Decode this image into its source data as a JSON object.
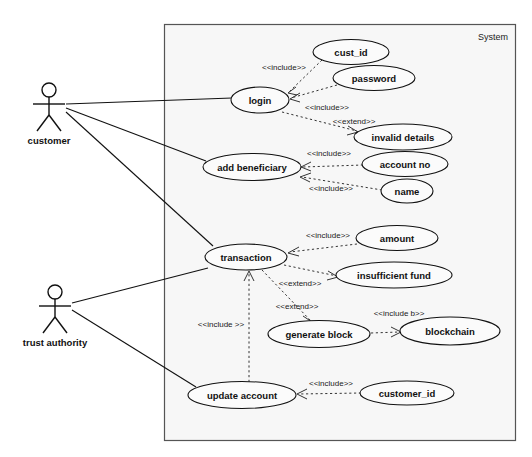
{
  "diagram": {
    "type": "uml-use-case-diagram",
    "system_boundary_label": "System",
    "actors": [
      {
        "id": "customer",
        "label": "customer",
        "x": 49,
        "y": 103
      },
      {
        "id": "trust-authority",
        "label": "trust authority",
        "x": 49,
        "y": 305
      }
    ],
    "use_cases": [
      {
        "id": "cust-id",
        "label": "cust_id",
        "cx": 351,
        "cy": 52,
        "rx": 38,
        "ry": 12
      },
      {
        "id": "password",
        "label": "password",
        "cx": 374,
        "cy": 78,
        "rx": 41,
        "ry": 12
      },
      {
        "id": "login",
        "label": "login",
        "cx": 260,
        "cy": 100,
        "rx": 29,
        "ry": 13
      },
      {
        "id": "invalid-details",
        "label": "invalid details",
        "cx": 403,
        "cy": 137,
        "rx": 49,
        "ry": 13
      },
      {
        "id": "add-beneficiary",
        "label": "add beneficiary",
        "cx": 252,
        "cy": 167,
        "rx": 49,
        "ry": 13
      },
      {
        "id": "account-no",
        "label": "account no",
        "cx": 405,
        "cy": 164,
        "rx": 43,
        "ry": 12
      },
      {
        "id": "name",
        "label": "name",
        "cx": 407,
        "cy": 191,
        "rx": 26,
        "ry": 12
      },
      {
        "id": "amount",
        "label": "amount",
        "cx": 397,
        "cy": 238,
        "rx": 41,
        "ry": 12
      },
      {
        "id": "transaction",
        "label": "transaction",
        "cx": 246,
        "cy": 257,
        "rx": 41,
        "ry": 13
      },
      {
        "id": "insufficient-fund",
        "label": "insufficient fund",
        "cx": 394,
        "cy": 275,
        "rx": 58,
        "ry": 13
      },
      {
        "id": "generate-block",
        "label": "generate block",
        "cx": 319,
        "cy": 334,
        "rx": 51,
        "ry": 13
      },
      {
        "id": "blockchain",
        "label": "blockchain",
        "cx": 450,
        "cy": 331,
        "rx": 50,
        "ry": 14
      },
      {
        "id": "update-account",
        "label": "update account",
        "cx": 242,
        "cy": 395,
        "rx": 54,
        "ry": 13
      },
      {
        "id": "customer-id",
        "label": "customer_id",
        "cx": 407,
        "cy": 393,
        "rx": 47,
        "ry": 12
      }
    ],
    "relationships": [
      {
        "id": "rel-cust-id-login",
        "stereotype": "<<include>>",
        "from": "cust_id",
        "to": "login",
        "label_x": 284,
        "label_y": 70
      },
      {
        "id": "rel-password-login",
        "stereotype": "<<include>>",
        "from": "password",
        "to": "login",
        "label_x": 327,
        "label_y": 107
      },
      {
        "id": "rel-login-invalid",
        "stereotype": "<<extend>>",
        "from": "invalid details",
        "to": "login",
        "label_x": 351,
        "label_y": 122
      },
      {
        "id": "rel-accountno-addben",
        "stereotype": "<<include>>",
        "from": "account no",
        "to": "add beneficiary",
        "label_x": 327,
        "label_y": 156
      },
      {
        "id": "rel-name-addben",
        "stereotype": "<<include>>",
        "from": "name",
        "to": "add beneficiary",
        "label_x": 330,
        "label_y": 187
      },
      {
        "id": "rel-amount-transaction",
        "stereotype": "<<include>>",
        "from": "amount",
        "to": "transaction",
        "label_x": 328,
        "label_y": 237
      },
      {
        "id": "rel-transaction-insufficient",
        "stereotype": "<<extend>>",
        "from": "transaction",
        "to": "insufficient fund",
        "label_x": 300,
        "label_y": 283
      },
      {
        "id": "rel-transaction-generate",
        "stereotype": "<<extend>>",
        "from": "transaction",
        "to": "generate block",
        "label_x": 297,
        "label_y": 306
      },
      {
        "id": "rel-generate-blockchain",
        "stereotype": "<<include b>>",
        "from": "generate block",
        "to": "blockchain",
        "label_x": 396,
        "label_y": 315
      },
      {
        "id": "rel-update-transaction",
        "stereotype": "<<include >>",
        "from": "update account",
        "to": "transaction",
        "label_x": 222,
        "label_y": 325
      },
      {
        "id": "rel-customerid-update",
        "stereotype": "<<include>>",
        "from": "customer_id",
        "to": "update account",
        "label_x": 331,
        "label_y": 385
      }
    ],
    "associations": [
      {
        "id": "assoc-customer-login",
        "from": "customer",
        "to": "login"
      },
      {
        "id": "assoc-customer-add-beneficiary",
        "from": "customer",
        "to": "add beneficiary"
      },
      {
        "id": "assoc-customer-transaction",
        "from": "customer",
        "to": "transaction"
      },
      {
        "id": "assoc-trust-transaction",
        "from": "trust authority",
        "to": "transaction"
      },
      {
        "id": "assoc-trust-update-account",
        "from": "trust authority",
        "to": "update account"
      }
    ],
    "colors": {
      "background": "#ffffff",
      "boundary_fill": "#f7f7f7",
      "boundary_stroke": "#555555",
      "ellipse_fill": "#fbfbfb",
      "ellipse_stroke": "#111111",
      "text": "#111111"
    }
  }
}
